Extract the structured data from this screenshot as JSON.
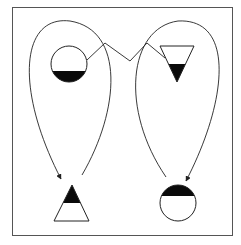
{
  "diagram": {
    "title": "",
    "frame": {
      "x": 12.5,
      "y": 7.5,
      "width": 220,
      "height": 228,
      "stroke": "#555555"
    },
    "colors": {
      "stroke": "#222222",
      "fill_dark": "#0a0a0a",
      "fill_light": "#ffffff"
    },
    "shapes": [
      {
        "id": "circle-top-left",
        "kind": "circle",
        "cx": 69,
        "cy": 64,
        "r": 18,
        "fill_portion": "bottom",
        "split_y": 71
      },
      {
        "id": "triangle-top-right",
        "kind": "triangle-down",
        "points": "160,46 194,46 177,82",
        "dark_from_y": 64
      },
      {
        "id": "triangle-bottom-left",
        "kind": "triangle-up",
        "apex": [
          72,
          185
        ],
        "base_y": 221,
        "base_left": 54,
        "base_right": 89,
        "dark_to_y": 203
      },
      {
        "id": "circle-bottom-right",
        "kind": "circle",
        "cx": 178,
        "cy": 203,
        "r": 18,
        "fill_portion": "top",
        "split_y": 196
      }
    ],
    "connectors": [
      {
        "id": "zigzag-link",
        "kind": "polyline",
        "points": "87,60 105,43 130,61 147,43 165,58"
      },
      {
        "id": "left-loop-arrow",
        "kind": "curve-arrow",
        "path": "M 82 175 C 120 110, 125 30, 70 21 C 20 15, 15 90, 61 179"
      },
      {
        "id": "right-loop-arrow",
        "kind": "curve-arrow",
        "path": "M 166 177 C 120 110, 128 28, 178 21 C 235 18, 228 100, 186 181"
      }
    ]
  }
}
